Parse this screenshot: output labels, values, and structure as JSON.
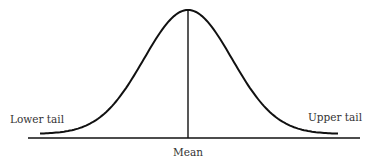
{
  "diagram": {
    "type": "normal-distribution-curve",
    "labels": {
      "lower_tail": "Lower tail",
      "upper_tail": "Upper tail",
      "mean": "Mean"
    },
    "colors": {
      "stroke": "#111111",
      "text": "#333333",
      "background": "#ffffff"
    }
  }
}
